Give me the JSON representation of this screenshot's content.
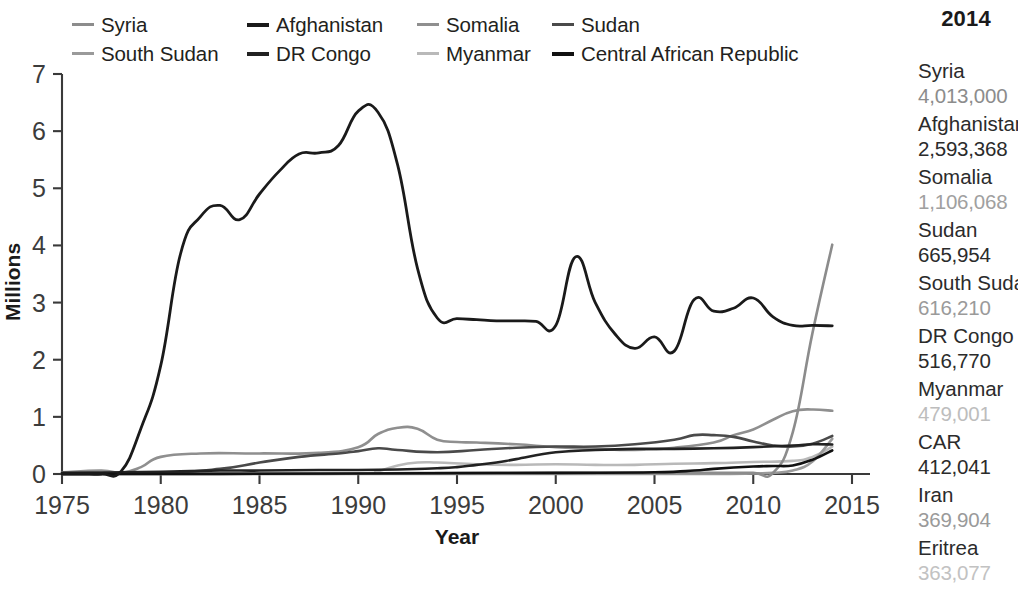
{
  "chart_data": {
    "type": "line",
    "title": "",
    "xlabel": "Year",
    "ylabel": "Millions",
    "xlim": [
      1975,
      2015
    ],
    "ylim": [
      0,
      7
    ],
    "xticks": [
      1975,
      1980,
      1985,
      1990,
      1995,
      2000,
      2005,
      2010,
      2015
    ],
    "yticks": [
      0,
      1,
      2,
      3,
      4,
      5,
      6,
      7
    ],
    "grid": false,
    "legend_position": "top",
    "series": [
      {
        "name": "Syria",
        "color": "#8c8c8c",
        "width": 2.6,
        "x": [
          1975,
          1980,
          1985,
          1990,
          1995,
          2000,
          2005,
          2008,
          2010,
          2011,
          2012,
          2013,
          2014
        ],
        "values": [
          0.01,
          0.01,
          0.01,
          0.01,
          0.02,
          0.02,
          0.02,
          0.02,
          0.02,
          0.02,
          0.73,
          2.47,
          4.013
        ]
      },
      {
        "name": "Afghanistan",
        "color": "#1a1a1a",
        "width": 2.8,
        "x": [
          1975,
          1976,
          1977,
          1978,
          1979,
          1980,
          1981,
          1982,
          1983,
          1984,
          1985,
          1986,
          1987,
          1988,
          1989,
          1990,
          1991,
          1992,
          1993,
          1994,
          1995,
          1996,
          1997,
          1998,
          1999,
          2000,
          2001,
          2002,
          2003,
          2004,
          2005,
          2006,
          2007,
          2008,
          2009,
          2010,
          2011,
          2012,
          2013,
          2014
        ],
        "values": [
          0.0,
          0.0,
          0.0,
          0.05,
          0.8,
          1.9,
          3.85,
          4.5,
          4.7,
          4.45,
          4.9,
          5.3,
          5.6,
          5.62,
          5.75,
          6.35,
          6.33,
          5.4,
          3.6,
          2.73,
          2.72,
          2.7,
          2.68,
          2.68,
          2.67,
          2.6,
          3.8,
          3.0,
          2.45,
          2.2,
          2.4,
          2.15,
          3.05,
          2.85,
          2.9,
          3.08,
          2.75,
          2.6,
          2.6,
          2.593
        ]
      },
      {
        "name": "Somalia",
        "color": "#8f8f8f",
        "width": 2.6,
        "x": [
          1975,
          1977,
          1978,
          1979,
          1980,
          1982,
          1985,
          1988,
          1990,
          1991,
          1992,
          1993,
          1994,
          1995,
          1996,
          1998,
          2000,
          2002,
          2004,
          2006,
          2008,
          2009,
          2010,
          2011,
          2012,
          2013,
          2014
        ],
        "values": [
          0.03,
          0.06,
          0.02,
          0.12,
          0.3,
          0.36,
          0.36,
          0.37,
          0.47,
          0.7,
          0.81,
          0.79,
          0.6,
          0.56,
          0.55,
          0.52,
          0.47,
          0.44,
          0.42,
          0.46,
          0.55,
          0.68,
          0.78,
          0.95,
          1.1,
          1.13,
          1.106
        ]
      },
      {
        "name": "Sudan",
        "color": "#4a4a4a",
        "width": 2.6,
        "x": [
          1975,
          1980,
          1983,
          1985,
          1987,
          1989,
          1990,
          1991,
          1992,
          1994,
          1996,
          1998,
          2000,
          2002,
          2004,
          2006,
          2007,
          2008,
          2009,
          2010,
          2011,
          2012,
          2013,
          2014
        ],
        "values": [
          0.01,
          0.02,
          0.09,
          0.2,
          0.3,
          0.36,
          0.4,
          0.45,
          0.42,
          0.38,
          0.42,
          0.46,
          0.48,
          0.48,
          0.52,
          0.6,
          0.68,
          0.68,
          0.65,
          0.57,
          0.5,
          0.48,
          0.53,
          0.666
        ]
      },
      {
        "name": "South Sudan",
        "color": "#9a9a9a",
        "width": 2.6,
        "x": [
          1975,
          1990,
          2000,
          2005,
          2008,
          2010,
          2011,
          2012,
          2013,
          2014
        ],
        "values": [
          0.0,
          0.0,
          0.0,
          0.0,
          0.0,
          0.01,
          0.02,
          0.06,
          0.22,
          0.616
        ]
      },
      {
        "name": "DR Congo",
        "color": "#222222",
        "width": 2.6,
        "x": [
          1975,
          1978,
          1980,
          1983,
          1985,
          1988,
          1990,
          1992,
          1994,
          1995,
          1996,
          1997,
          1998,
          2000,
          2002,
          2004,
          2006,
          2008,
          2010,
          2012,
          2013,
          2014
        ],
        "values": [
          0.02,
          0.03,
          0.04,
          0.06,
          0.06,
          0.07,
          0.07,
          0.08,
          0.1,
          0.12,
          0.16,
          0.2,
          0.26,
          0.38,
          0.42,
          0.44,
          0.44,
          0.45,
          0.47,
          0.5,
          0.52,
          0.517
        ]
      },
      {
        "name": "Myanmar",
        "color": "#b9b9b9",
        "width": 2.6,
        "x": [
          1975,
          1985,
          1990,
          1991,
          1992,
          1993,
          1994,
          1996,
          1998,
          2000,
          2002,
          2004,
          2006,
          2008,
          2010,
          2012,
          2013,
          2014
        ],
        "values": [
          0.0,
          0.0,
          0.01,
          0.05,
          0.15,
          0.2,
          0.2,
          0.17,
          0.16,
          0.17,
          0.16,
          0.16,
          0.18,
          0.19,
          0.21,
          0.23,
          0.3,
          0.479
        ]
      },
      {
        "name": "Central African Republic",
        "color": "#111111",
        "width": 2.6,
        "x": [
          1975,
          1980,
          1990,
          2000,
          2005,
          2007,
          2008,
          2010,
          2011,
          2012,
          2013,
          2014
        ],
        "values": [
          0.0,
          0.0,
          0.01,
          0.02,
          0.03,
          0.06,
          0.09,
          0.13,
          0.14,
          0.15,
          0.25,
          0.412
        ]
      }
    ]
  },
  "legend": {
    "items": [
      {
        "label": "Syria",
        "color": "#8c8c8c"
      },
      {
        "label": "Afghanistan",
        "color": "#1a1a1a"
      },
      {
        "label": "Somalia",
        "color": "#8f8f8f"
      },
      {
        "label": "Sudan",
        "color": "#4a4a4a"
      },
      {
        "label": "South Sudan",
        "color": "#9a9a9a"
      },
      {
        "label": "DR Congo",
        "color": "#222222"
      },
      {
        "label": "Myanmar",
        "color": "#b9b9b9"
      },
      {
        "label": "Central African Republic",
        "color": "#111111"
      }
    ]
  },
  "side_panel": {
    "year": "2014",
    "entries": [
      {
        "name": "Syria",
        "value": "4,013,000",
        "value_color": "#8c8c8c"
      },
      {
        "name": "Afghanistan",
        "value": "2,593,368",
        "value_color": "#2b2b2b"
      },
      {
        "name": "Somalia",
        "value": "1,106,068",
        "value_color": "#a0a0a0"
      },
      {
        "name": "Sudan",
        "value": "665,954",
        "value_color": "#2b2b2b"
      },
      {
        "name": "South Sudan",
        "value": "616,210",
        "value_color": "#9a9a9a"
      },
      {
        "name": "DR Congo",
        "value": "516,770",
        "value_color": "#2b2b2b"
      },
      {
        "name": "Myanmar",
        "value": "479,001",
        "value_color": "#bdbdbd"
      },
      {
        "name": "CAR",
        "value": "412,041",
        "value_color": "#2b2b2b"
      },
      {
        "name": "Iran",
        "value": "369,904",
        "value_color": "#9a9a9a"
      },
      {
        "name": "Eritrea",
        "value": "363,077",
        "value_color": "#c2c2c2"
      }
    ]
  }
}
